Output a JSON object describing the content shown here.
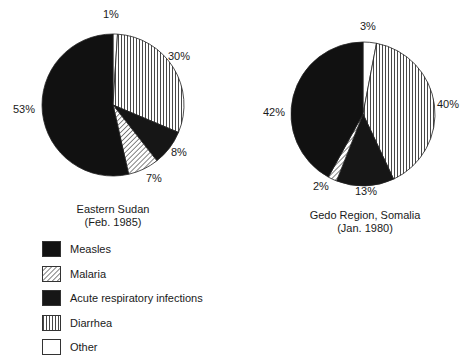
{
  "chart_data": [
    {
      "type": "pie",
      "title": "Eastern Sudan (Feb. 1985)",
      "categories": [
        "Measles",
        "Malaria",
        "Acute respiratory infections",
        "Diarrhea",
        "Other"
      ],
      "values": [
        53,
        7,
        8,
        30,
        1
      ],
      "labels": [
        "53%",
        "7%",
        "8%",
        "30%",
        "1%"
      ]
    },
    {
      "type": "pie",
      "title": "Gedo Region, Somalia (Jan. 1980)",
      "categories": [
        "Measles",
        "Malaria",
        "Acute respiratory infections",
        "Diarrhea",
        "Other"
      ],
      "values": [
        42,
        2,
        13,
        40,
        3
      ],
      "labels": [
        "42%",
        "2%",
        "13%",
        "40%",
        "3%"
      ]
    }
  ],
  "pies": {
    "left": {
      "caption_line1": "Eastern Sudan",
      "caption_line2": "(Feb. 1985)",
      "labels": {
        "other": "1%",
        "diarrhea": "30%",
        "ari": "8%",
        "malaria": "7%",
        "measles": "53%"
      }
    },
    "right": {
      "caption_line1": "Gedo Region, Somalia",
      "caption_line2": "(Jan. 1980)",
      "labels": {
        "other": "3%",
        "diarrhea": "40%",
        "ari": "13%",
        "malaria": "2%",
        "measles": "42%"
      }
    }
  },
  "legend": {
    "items": [
      {
        "label": "Measles",
        "pattern": "solid-black",
        "color": "#111111"
      },
      {
        "label": "Malaria",
        "pattern": "diagonal-hatch",
        "color": "#444444"
      },
      {
        "label": "Acute respiratory infections",
        "pattern": "solid-black",
        "color": "#161616"
      },
      {
        "label": "Diarrhea",
        "pattern": "vertical-lines",
        "color": "#444444"
      },
      {
        "label": "Other",
        "pattern": "white",
        "color": "#ffffff"
      }
    ]
  }
}
